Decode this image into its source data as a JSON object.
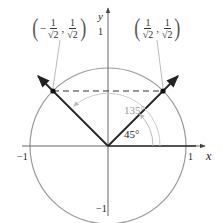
{
  "diagram": {
    "type": "unit circle",
    "axes": {
      "x_label": "x",
      "y_label": "y"
    },
    "ticks": {
      "x_neg": "−1",
      "x_pos": "1",
      "y_pos": "1",
      "y_neg": "−1"
    },
    "angles": [
      {
        "label": "45°",
        "degrees": 45
      },
      {
        "label": "135°",
        "degrees": 135
      }
    ],
    "points": [
      {
        "name": "right",
        "x_num": "1",
        "x_den": "√2",
        "y_num": "1",
        "y_den": "√2",
        "x_sign": ""
      },
      {
        "name": "left",
        "x_num": "1",
        "x_den": "√2",
        "y_num": "1",
        "y_den": "√2",
        "x_sign": "−"
      }
    ],
    "colors": {
      "circle": "#9a9a9a",
      "axis": "#555555",
      "ray": "#222222",
      "dashed": "#333333",
      "arc": "#c8c8c8"
    }
  }
}
